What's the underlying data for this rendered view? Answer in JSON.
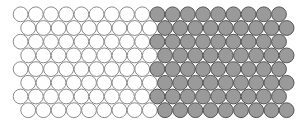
{
  "diagram": {
    "rows": 8,
    "circles_per_row": 18,
    "groups": [
      {
        "name": "white",
        "count_per_row": 9,
        "fill": "#ffffff",
        "stroke": "#8a8a8a"
      },
      {
        "name": "gray",
        "count_per_row": 9,
        "fill": "#9a9a9a",
        "stroke": "#555555"
      }
    ],
    "packing": "hexagonal, alternate rows offset by half a circle"
  }
}
